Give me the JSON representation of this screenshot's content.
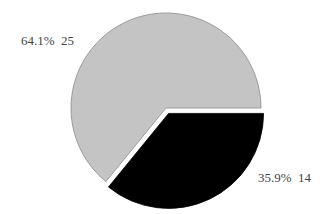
{
  "chart_data": {
    "type": "pie",
    "title": "",
    "slices": [
      {
        "label": "",
        "percent": 64.1,
        "value": 25,
        "color": "#c4c4c4",
        "label_text": "64.1%  25",
        "exploded": false
      },
      {
        "label": "",
        "percent": 35.9,
        "value": 14,
        "color": "#000000",
        "label_text": "35.9%  14",
        "exploded": true
      }
    ],
    "total": 39,
    "start_angle_deg": 0,
    "direction": "clockwise",
    "legend": null
  }
}
